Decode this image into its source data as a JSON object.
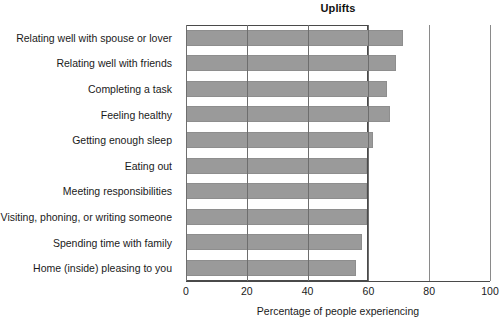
{
  "chart_data": {
    "type": "bar",
    "orientation": "horizontal",
    "title": "Uplifts",
    "xlabel": "Percentage of people experiencing",
    "ylabel": "",
    "xlim": [
      0,
      100
    ],
    "xticks": [
      0,
      20,
      40,
      60,
      80,
      100
    ],
    "xtick_labels": [
      "0",
      "20",
      "40",
      "60",
      "80",
      "100"
    ],
    "grid": true,
    "legend": null,
    "bar_color": "#9a9a9a",
    "axis_color": "#4a4a4a",
    "categories": [
      "Relating well with spouse or lover",
      "Relating well with friends",
      "Completing a task",
      "Feeling healthy",
      "Getting enough sleep",
      "Eating out",
      "Meeting responsibilities",
      "Visiting, phoning, or writing someone",
      "Spending time with family",
      "Home (inside) pleasing to you"
    ],
    "values": [
      71.5,
      69,
      66,
      67,
      61.5,
      59.5,
      59.5,
      59.5,
      58,
      56
    ]
  }
}
